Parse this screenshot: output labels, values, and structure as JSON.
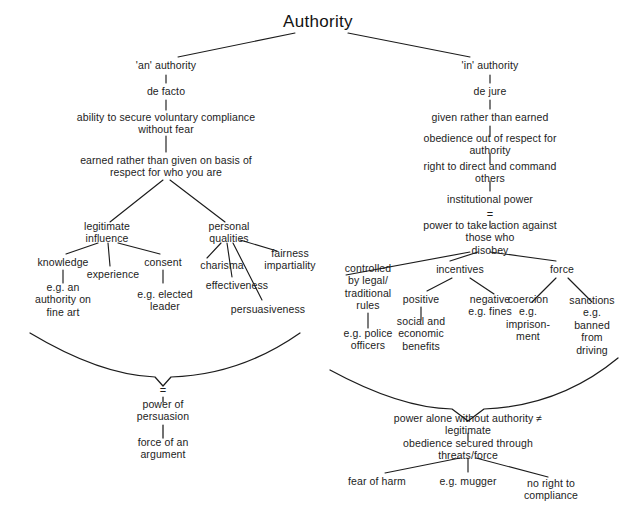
{
  "diagram": {
    "title": "Authority",
    "type": "concept-map",
    "ink_color": "#1c1c1c",
    "background": "#ffffff",
    "nodes": [
      {
        "id": "root",
        "text": "Authority",
        "x": 318,
        "y": 22,
        "size": "root"
      },
      {
        "id": "an_authority",
        "text": "'an' authority",
        "x": 166,
        "y": 65
      },
      {
        "id": "de_facto",
        "text": "de facto",
        "x": 166,
        "y": 91
      },
      {
        "id": "ability",
        "text": "ability to secure voluntary compliance\nwithout fear",
        "x": 166,
        "y": 123
      },
      {
        "id": "earned",
        "text": "earned rather than given on basis of\nrespect for who you are",
        "x": 166,
        "y": 166
      },
      {
        "id": "legitimate",
        "text": "legitimate\ninfluence",
        "x": 107,
        "y": 232
      },
      {
        "id": "knowledge",
        "text": "knowledge",
        "x": 63,
        "y": 262
      },
      {
        "id": "experience",
        "text": "experience",
        "x": 113,
        "y": 274
      },
      {
        "id": "consent",
        "text": "consent",
        "x": 163,
        "y": 262
      },
      {
        "id": "eg_fine_art",
        "text": "e.g. an\nauthority on\nfine art",
        "x": 63,
        "y": 300
      },
      {
        "id": "eg_elected",
        "text": "e.g. elected\nleader",
        "x": 165,
        "y": 300
      },
      {
        "id": "personal",
        "text": "personal\nqualities",
        "x": 229,
        "y": 232
      },
      {
        "id": "charisma",
        "text": "charisma",
        "x": 222,
        "y": 265
      },
      {
        "id": "fairness",
        "text": "fairness\nimpartiality",
        "x": 290,
        "y": 259
      },
      {
        "id": "effectiveness",
        "text": "effectiveness",
        "x": 237,
        "y": 285
      },
      {
        "id": "persuasiveness",
        "text": "persuasiveness",
        "x": 268,
        "y": 309
      },
      {
        "id": "brace_left_eq",
        "text": "=",
        "x": 163,
        "y": 390,
        "size": "eqsym"
      },
      {
        "id": "power_pers",
        "text": "power of\npersuasion",
        "x": 163,
        "y": 410
      },
      {
        "id": "force_arg",
        "text": "force of an\nargument",
        "x": 163,
        "y": 448
      },
      {
        "id": "in_authority",
        "text": "'in' authority",
        "x": 490,
        "y": 65
      },
      {
        "id": "de_jure",
        "text": "de jure",
        "x": 490,
        "y": 91
      },
      {
        "id": "given",
        "text": "given rather than earned",
        "x": 490,
        "y": 117
      },
      {
        "id": "obedience_resp",
        "text": "obedience out of respect for authority",
        "x": 490,
        "y": 144
      },
      {
        "id": "right_direct",
        "text": "right to direct and command others",
        "x": 490,
        "y": 172
      },
      {
        "id": "inst_power",
        "text": "institutional power",
        "x": 490,
        "y": 199
      },
      {
        "id": "inst_eq",
        "text": "=",
        "x": 490,
        "y": 214,
        "size": "eqsym"
      },
      {
        "id": "power_action",
        "text": "power to take action against those who\ndisobey",
        "x": 490,
        "y": 238
      },
      {
        "id": "controlled",
        "text": "controlled\nby legal/\ntraditional\nrules",
        "x": 368,
        "y": 287
      },
      {
        "id": "eg_police",
        "text": "e.g. police\nofficers",
        "x": 368,
        "y": 339
      },
      {
        "id": "incentives",
        "text": "incentives",
        "x": 460,
        "y": 269
      },
      {
        "id": "positive",
        "text": "positive",
        "x": 421,
        "y": 299
      },
      {
        "id": "negative",
        "text": "negative\ne.g. fines",
        "x": 490,
        "y": 305
      },
      {
        "id": "social_econ",
        "text": "social and\neconomic\nbenefits",
        "x": 421,
        "y": 334
      },
      {
        "id": "force",
        "text": "force",
        "x": 562,
        "y": 269
      },
      {
        "id": "coercion",
        "text": "coercion\ne.g.\nimprison-\nment",
        "x": 528,
        "y": 318
      },
      {
        "id": "sanctions",
        "text": "sanctions\ne.g.\nbanned\nfrom\ndriving",
        "x": 592,
        "y": 325
      },
      {
        "id": "power_alone",
        "text": "power alone without authority ≠ legitimate",
        "x": 468,
        "y": 424
      },
      {
        "id": "obedience_sec",
        "text": "obedience secured through threats/force",
        "x": 468,
        "y": 449
      },
      {
        "id": "fear_harm",
        "text": "fear of harm",
        "x": 377,
        "y": 481
      },
      {
        "id": "eg_mugger",
        "text": "e.g. mugger",
        "x": 468,
        "y": 481
      },
      {
        "id": "no_right",
        "text": "no right to\ncompliance",
        "x": 551,
        "y": 489
      }
    ],
    "edges": [
      {
        "from": "root",
        "to": "an_authority",
        "d": "M 295 33 L 178 57"
      },
      {
        "from": "root",
        "to": "in_authority",
        "d": "M 348 33 L 470 57"
      },
      {
        "from": "an_authority",
        "to": "de_facto",
        "d": "M 166 75 L 166 83"
      },
      {
        "from": "de_facto",
        "to": "ability",
        "d": "M 166 100 L 166 110"
      },
      {
        "from": "ability",
        "to": "earned",
        "d": "M 166 136 L 166 152"
      },
      {
        "from": "earned",
        "to": "legitimate",
        "d": "M 163 180 L 110 222"
      },
      {
        "from": "earned",
        "to": "personal",
        "d": "M 170 180 L 225 222"
      },
      {
        "from": "legitimate",
        "to": "knowledge",
        "d": "M 98 243 L 66 254"
      },
      {
        "from": "legitimate",
        "to": "experience",
        "d": "M 108 243 L 110 266"
      },
      {
        "from": "legitimate",
        "to": "consent",
        "d": "M 118 243 L 160 254"
      },
      {
        "from": "knowledge",
        "to": "eg_fine_art",
        "d": "M 63 270 L 63 283"
      },
      {
        "from": "consent",
        "to": "eg_elected",
        "d": "M 163 270 L 163 283"
      },
      {
        "from": "personal",
        "to": "charisma",
        "d": "M 221 243 L 207 258"
      },
      {
        "from": "personal",
        "to": "fairness",
        "d": "M 240 240 L 277 251"
      },
      {
        "from": "personal",
        "to": "effectiveness",
        "d": "M 227 243 L 232 277"
      },
      {
        "from": "personal",
        "to": "persuasiveness",
        "d": "M 233 243 L 262 300"
      },
      {
        "from": "in_authority",
        "to": "de_jure",
        "d": "M 490 75 L 490 83"
      },
      {
        "from": "de_jure",
        "to": "given",
        "d": "M 490 100 L 490 109"
      },
      {
        "from": "given",
        "to": "obedience_resp",
        "d": "M 490 126 L 490 136"
      },
      {
        "from": "obedience_resp",
        "to": "right_direct",
        "d": "M 490 153 L 490 164"
      },
      {
        "from": "right_direct",
        "to": "inst_power",
        "d": "M 490 181 L 490 191"
      },
      {
        "from": "inst_power",
        "to": "power_action",
        "d": "M 490 221 L 490 228"
      },
      {
        "from": "power_action",
        "to": "controlled",
        "d": "M 470 252 L 346 275"
      },
      {
        "from": "power_action",
        "to": "incentives",
        "d": "M 478 252 L 450 261"
      },
      {
        "from": "power_action",
        "to": "force",
        "d": "M 490 252 L 556 261"
      },
      {
        "from": "controlled",
        "to": "eg_police",
        "d": "M 368 313 L 368 328"
      },
      {
        "from": "incentives",
        "to": "positive",
        "d": "M 452 278 L 427 291"
      },
      {
        "from": "incentives",
        "to": "negative",
        "d": "M 470 278 L 494 294"
      },
      {
        "from": "positive",
        "to": "social_econ",
        "d": "M 421 307 L 421 320"
      },
      {
        "from": "force",
        "to": "coercion",
        "d": "M 556 278 L 532 302"
      },
      {
        "from": "force",
        "to": "sanctions",
        "d": "M 568 278 L 592 302"
      },
      {
        "from": "power_alone",
        "to": "obedience_sec",
        "d": "M 468 433 L 468 441"
      },
      {
        "from": "obedience_sec",
        "to": "fear_harm",
        "d": "M 460 458 L 385 473"
      },
      {
        "from": "obedience_sec",
        "to": "eg_mugger",
        "d": "M 468 458 L 468 472"
      },
      {
        "from": "obedience_sec",
        "to": "no_right",
        "d": "M 476 458 L 548 477"
      }
    ],
    "braces": [
      {
        "id": "brace-left",
        "label": "left-summary-brace",
        "d": "M 30 333 Q 100 375 155 377 L 163 386 L 171 377 Q 240 375 300 333"
      },
      {
        "id": "brace-right",
        "label": "right-summary-brace",
        "d": "M 330 370 Q 400 408 452 409 L 468 421 L 484 409 Q 560 406 618 358"
      }
    ],
    "brace_stems": [
      {
        "id": "left-stem",
        "d": "M 163 397 L 163 402"
      },
      {
        "id": "left-stem2",
        "d": "M 163 425 L 163 438"
      }
    ]
  }
}
